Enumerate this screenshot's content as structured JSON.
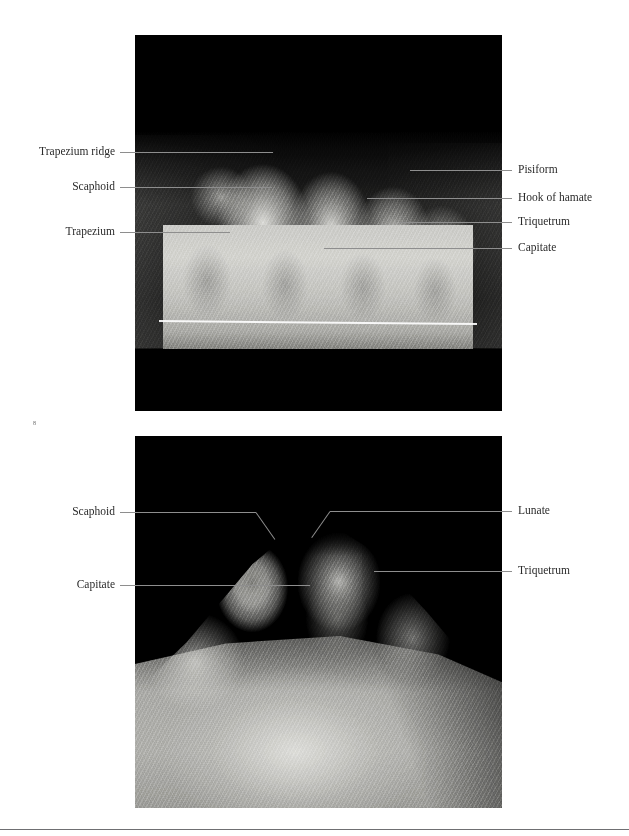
{
  "figure": {
    "panels": [
      {
        "id": "panel-top",
        "name": "carpal-tunnel-radiograph-top",
        "labels": [
          {
            "text": "Trapezium ridge",
            "side": "left",
            "y": 152,
            "leader_from": 120,
            "leader_to": 273
          },
          {
            "text": "Scaphoid",
            "side": "left",
            "y": 187,
            "leader_from": 120,
            "leader_to": 272
          },
          {
            "text": "Trapezium",
            "side": "left",
            "y": 232,
            "leader_from": 120,
            "leader_to": 230
          },
          {
            "text": "Pisiform",
            "side": "right",
            "y": 170,
            "leader_from": 410,
            "leader_to": 512
          },
          {
            "text": "Hook of hamate",
            "side": "right",
            "y": 198,
            "leader_from": 367,
            "leader_to": 512
          },
          {
            "text": "Triquetrum",
            "side": "right",
            "y": 222,
            "leader_from": 399,
            "leader_to": 512
          },
          {
            "text": "Capitate",
            "side": "right",
            "y": 248,
            "leader_from": 324,
            "leader_to": 512
          }
        ]
      },
      {
        "id": "panel-bot",
        "name": "carpal-tunnel-radiograph-bottom",
        "labels": [
          {
            "text": "Scaphoid",
            "side": "left",
            "y": 512,
            "leader_from": 120,
            "leader_to": 256
          },
          {
            "text": "Capitate",
            "side": "left",
            "y": 585,
            "leader_from": 120,
            "leader_to": 310
          },
          {
            "text": "Lunate",
            "side": "right",
            "y": 511,
            "leader_from": 330,
            "leader_to": 512
          },
          {
            "text": "Triquetrum",
            "side": "right",
            "y": 571,
            "leader_from": 374,
            "leader_to": 512
          }
        ]
      }
    ],
    "page_mark": "8"
  }
}
